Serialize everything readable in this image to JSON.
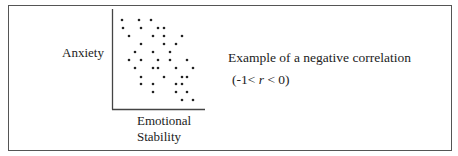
{
  "figure": {
    "y_axis_label": "Anxiety",
    "x_axis_label_line1": "Emotional",
    "x_axis_label_line2": "Stability",
    "caption_line1": "Example of a negative correlation",
    "caption_range_prefix": "(-1< ",
    "caption_range_var": "r",
    "caption_range_suffix": " < 0)"
  },
  "chart_data": {
    "type": "scatter",
    "xlabel": "Emotional Stability",
    "ylabel": "Anxiety",
    "grid": false,
    "ticks": false,
    "axis_pixel_box": {
      "x0": 112,
      "x1": 205,
      "y_top": 9,
      "y_bottom": 109
    },
    "points_px": [
      [
        122,
        20
      ],
      [
        139,
        20
      ],
      [
        151,
        20
      ],
      [
        123,
        28
      ],
      [
        141,
        28
      ],
      [
        158,
        28
      ],
      [
        164,
        28
      ],
      [
        129,
        36
      ],
      [
        153,
        36
      ],
      [
        164,
        36
      ],
      [
        182,
        36
      ],
      [
        141,
        44
      ],
      [
        164,
        44
      ],
      [
        176,
        44
      ],
      [
        135,
        52
      ],
      [
        153,
        52
      ],
      [
        170,
        52
      ],
      [
        129,
        60
      ],
      [
        141,
        60
      ],
      [
        158,
        60
      ],
      [
        170,
        60
      ],
      [
        187,
        60
      ],
      [
        135,
        68
      ],
      [
        153,
        68
      ],
      [
        158,
        68
      ],
      [
        176,
        68
      ],
      [
        193,
        68
      ],
      [
        141,
        77
      ],
      [
        164,
        77
      ],
      [
        182,
        77
      ],
      [
        187,
        77
      ],
      [
        141,
        84
      ],
      [
        153,
        84
      ],
      [
        176,
        84
      ],
      [
        182,
        84
      ],
      [
        153,
        92
      ],
      [
        176,
        92
      ],
      [
        187,
        92
      ],
      [
        182,
        100
      ],
      [
        193,
        100
      ]
    ]
  }
}
